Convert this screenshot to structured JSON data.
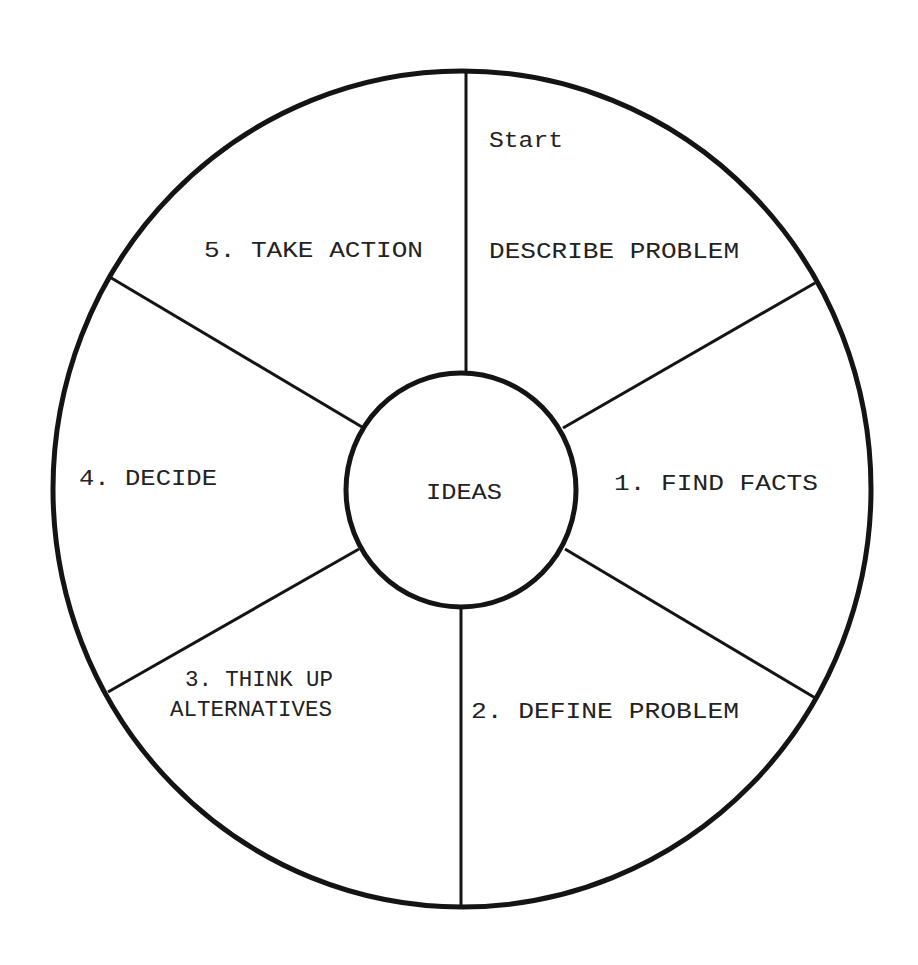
{
  "diagram": {
    "type": "circular-process-wheel",
    "center_label": "IDEAS",
    "start_note": "Start",
    "segments": [
      {
        "step": "",
        "label": "DESCRIBE PROBLEM"
      },
      {
        "step": "1",
        "label": "1. FIND FACTS"
      },
      {
        "step": "2",
        "label": "2. DEFINE PROBLEM"
      },
      {
        "step": "3",
        "label_line1": "3. THINK UP",
        "label_line2": "ALTERNATIVES"
      },
      {
        "step": "4",
        "label": "4. DECIDE"
      },
      {
        "step": "5",
        "label": "5. TAKE ACTION"
      }
    ],
    "colors": {
      "stroke": "#141414",
      "text": "#222222",
      "background": "#ffffff"
    }
  }
}
